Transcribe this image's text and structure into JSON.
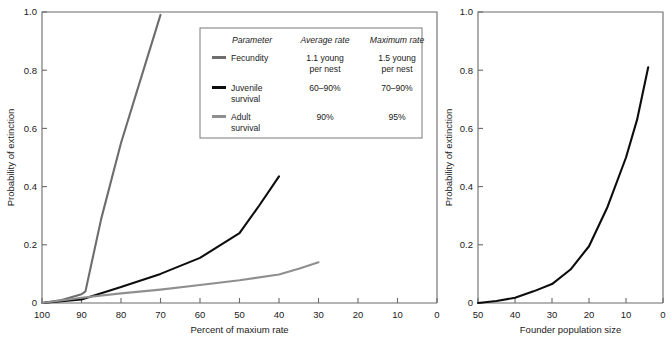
{
  "figure": {
    "background": "#ffffff",
    "panels": [
      "left-panel",
      "right-panel"
    ]
  },
  "colors": {
    "fecundity": "#6d6d6d",
    "juvenile": "#0d0d0d",
    "adult": "#8f8f8f",
    "axis": "#6a6a6a",
    "text": "#1a1a1a",
    "legend_border": "#7a7a7a"
  },
  "legend": {
    "headers": [
      "Parameter",
      "Average rate",
      "Maximum rate"
    ],
    "rows": [
      {
        "swatch": "fecundity",
        "parameter": "Fecundity",
        "parameter_line2": "",
        "average": "1.1 young",
        "average_line2": "per nest",
        "maximum": "1.5 young",
        "maximum_line2": "per nest"
      },
      {
        "swatch": "juvenile",
        "parameter": "Juvenile",
        "parameter_line2": "survival",
        "average": "60–90%",
        "average_line2": "",
        "maximum": "70–90%",
        "maximum_line2": ""
      },
      {
        "swatch": "adult",
        "parameter": "Adult",
        "parameter_line2": "survival",
        "average": "90%",
        "average_line2": "",
        "maximum": "95%",
        "maximum_line2": ""
      }
    ]
  },
  "chart_data": [
    {
      "id": "left-panel",
      "type": "line",
      "title": "",
      "xlabel": "Percent of maxium rate",
      "ylabel": "Probability of extinction",
      "xlim": [
        100,
        0
      ],
      "ylim": [
        0,
        1.0
      ],
      "x_reversed": true,
      "grid": false,
      "legend_position": "inside-top-right",
      "xticks": [
        100,
        90,
        80,
        70,
        60,
        50,
        40,
        30,
        20,
        10,
        0
      ],
      "xticklabels": [
        "100",
        "90",
        "80",
        "70",
        "60",
        "50",
        "40",
        "30",
        "20",
        "10",
        "0"
      ],
      "yticks": [
        0,
        0.2,
        0.4,
        0.6,
        0.8,
        1.0
      ],
      "yticklabels": [
        "0",
        "0.2",
        "0.4",
        "0.6",
        "0.8",
        "1.0"
      ],
      "series": [
        {
          "name": "Fecundity",
          "color_key": "fecundity",
          "x": [
            100,
            95,
            90,
            89,
            85,
            80,
            75,
            70
          ],
          "values": [
            0.0,
            0.01,
            0.03,
            0.04,
            0.29,
            0.55,
            0.77,
            0.99
          ]
        },
        {
          "name": "Juvenile survival",
          "color_key": "juvenile",
          "x": [
            100,
            90,
            80,
            70,
            60,
            50,
            45,
            40
          ],
          "values": [
            0.0,
            0.012,
            0.055,
            0.1,
            0.155,
            0.24,
            0.335,
            0.435
          ]
        },
        {
          "name": "Adult survival",
          "color_key": "adult",
          "x": [
            100,
            90,
            80,
            70,
            60,
            50,
            40,
            35,
            30
          ],
          "values": [
            0.0,
            0.018,
            0.033,
            0.046,
            0.062,
            0.078,
            0.098,
            0.118,
            0.14
          ]
        }
      ]
    },
    {
      "id": "right-panel",
      "type": "line",
      "title": "",
      "xlabel": "Founder population size",
      "ylabel": "Probability of extinction",
      "xlim": [
        50,
        0
      ],
      "ylim": [
        0,
        1.0
      ],
      "x_reversed": true,
      "grid": false,
      "legend_position": "none",
      "xticks": [
        50,
        40,
        30,
        20,
        10,
        0
      ],
      "xticklabels": [
        "50",
        "40",
        "30",
        "20",
        "10",
        "0"
      ],
      "yticks": [
        0,
        0.2,
        0.4,
        0.6,
        0.8,
        1.0
      ],
      "yticklabels": [
        "0",
        "0.2",
        "0.4",
        "0.6",
        "0.8",
        "1.0"
      ],
      "series": [
        {
          "name": "Extinction probability",
          "color_key": "juvenile",
          "x": [
            50,
            45,
            40,
            35,
            30,
            25,
            20,
            15,
            10,
            7,
            4
          ],
          "values": [
            0.0,
            0.007,
            0.018,
            0.04,
            0.065,
            0.115,
            0.195,
            0.33,
            0.5,
            0.63,
            0.81
          ]
        }
      ]
    }
  ]
}
